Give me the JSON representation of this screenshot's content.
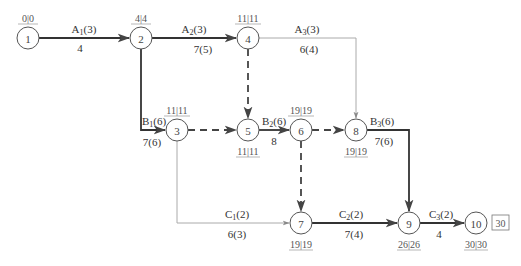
{
  "diagram": {
    "type": "double-code network diagram (time-scaled critical path)",
    "nodes": [
      {
        "id": "1",
        "x": 28,
        "y": 38,
        "time_label": "0|0",
        "label_pos": "above"
      },
      {
        "id": "2",
        "x": 141,
        "y": 38,
        "time_label": "4|4",
        "label_pos": "above"
      },
      {
        "id": "3",
        "x": 177,
        "y": 130,
        "time_label": "11|11",
        "label_pos": "above"
      },
      {
        "id": "4",
        "x": 248,
        "y": 38,
        "time_label": "11|11",
        "label_pos": "above"
      },
      {
        "id": "5",
        "x": 248,
        "y": 130,
        "time_label": "11|11",
        "label_pos": "below"
      },
      {
        "id": "6",
        "x": 301,
        "y": 130,
        "time_label": "19|19",
        "label_pos": "above"
      },
      {
        "id": "7",
        "x": 301,
        "y": 223,
        "time_label": "19|19",
        "label_pos": "below"
      },
      {
        "id": "8",
        "x": 356,
        "y": 130,
        "time_label": "19|19",
        "label_pos": "below"
      },
      {
        "id": "9",
        "x": 409,
        "y": 223,
        "time_label": "26|26",
        "label_pos": "below"
      },
      {
        "id": "10",
        "x": 476,
        "y": 223,
        "time_label": "30|30",
        "label_pos": "below"
      }
    ],
    "final_box": "30",
    "activities": [
      {
        "from": "1",
        "to": "2",
        "name": "A",
        "sub": "1",
        "res": "(3)",
        "duration": "4",
        "critical": true
      },
      {
        "from": "2",
        "to": "4",
        "name": "A",
        "sub": "2",
        "res": "(3)",
        "duration": "7(5)",
        "critical": true
      },
      {
        "from": "4",
        "to": "8",
        "name": "A",
        "sub": "3",
        "res": "(3)",
        "duration": "6(4)",
        "critical": false
      },
      {
        "from": "2",
        "to": "3",
        "name": "B",
        "sub": "1",
        "res": "(6)",
        "duration": "7(6)",
        "critical": true
      },
      {
        "from": "5",
        "to": "6",
        "name": "B",
        "sub": "2",
        "res": "(6)",
        "duration": "8",
        "critical": true
      },
      {
        "from": "8",
        "to": "9",
        "name": "B",
        "sub": "3",
        "res": "(6)",
        "duration": "7(6)",
        "critical": true
      },
      {
        "from": "3",
        "to": "7",
        "name": "C",
        "sub": "1",
        "res": "(2)",
        "duration": "6(3)",
        "critical": false
      },
      {
        "from": "7",
        "to": "9",
        "name": "C",
        "sub": "2",
        "res": "(2)",
        "duration": "7(4)",
        "critical": true
      },
      {
        "from": "9",
        "to": "10",
        "name": "C",
        "sub": "3",
        "res": "(2)",
        "duration": "4",
        "critical": true
      }
    ],
    "dummies": [
      {
        "from": "3",
        "to": "5"
      },
      {
        "from": "4",
        "to": "5"
      },
      {
        "from": "6",
        "to": "8"
      },
      {
        "from": "6",
        "to": "7"
      }
    ]
  },
  "labels": {
    "n1": "1",
    "n2": "2",
    "n3": "3",
    "n4": "4",
    "n5": "5",
    "n6": "6",
    "n7": "7",
    "n8": "8",
    "n9": "9",
    "n10": "10",
    "t1": "0|0",
    "t2": "4|4",
    "t3": "11|11",
    "t4": "11|11",
    "t5": "11|11",
    "t6": "19|19",
    "t7": "19|19",
    "t8": "19|19",
    "t9": "26|26",
    "t10": "30|30",
    "box10": "30",
    "a1_name": "A",
    "a1_sub": "1",
    "a1_res": "(3)",
    "a1_dur": "4",
    "a2_name": "A",
    "a2_sub": "2",
    "a2_res": "(3)",
    "a2_dur": "7(5)",
    "a3_name": "A",
    "a3_sub": "3",
    "a3_res": "(3)",
    "a3_dur": "6(4)",
    "b1_name": "B",
    "b1_sub": "1",
    "b1_res": "(6)",
    "b1_dur": "7(6)",
    "b2_name": "B",
    "b2_sub": "2",
    "b2_res": "(6)",
    "b2_dur": "8",
    "b3_name": "B",
    "b3_sub": "3",
    "b3_res": "(6)",
    "b3_dur": "7(6)",
    "c1_name": "C",
    "c1_sub": "1",
    "c1_res": "(2)",
    "c1_dur": "6(3)",
    "c2_name": "C",
    "c2_sub": "2",
    "c2_res": "(2)",
    "c2_dur": "7(4)",
    "c3_name": "C",
    "c3_sub": "3",
    "c3_res": "(2)",
    "c3_dur": "4"
  }
}
